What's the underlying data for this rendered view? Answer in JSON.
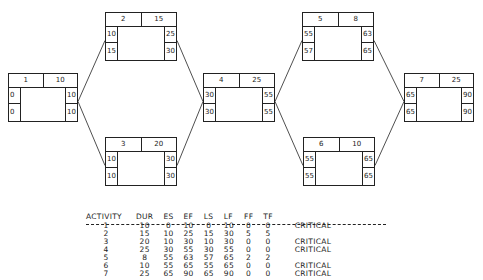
{
  "nodes": [
    {
      "id": "1",
      "dur": "10",
      "es": "0",
      "ls": "0",
      "ef": "10",
      "lf": "10",
      "x": 8,
      "y": 73,
      "w": 70,
      "h": 49
    },
    {
      "id": "2",
      "dur": "15",
      "es": "10",
      "ls": "15",
      "ef": "25",
      "lf": "30",
      "x": 105,
      "y": 12,
      "w": 72,
      "h": 49
    },
    {
      "id": "3",
      "dur": "20",
      "es": "10",
      "ls": "10",
      "ef": "30",
      "lf": "30",
      "x": 105,
      "y": 137,
      "w": 72,
      "h": 49
    },
    {
      "id": "4",
      "dur": "25",
      "es": "30",
      "ls": "30",
      "ef": "55",
      "lf": "55",
      "x": 203,
      "y": 73,
      "w": 72,
      "h": 49
    },
    {
      "id": "5",
      "dur": "8",
      "es": "55",
      "ls": "57",
      "ef": "63",
      "lf": "65",
      "x": 302,
      "y": 12,
      "w": 72,
      "h": 49
    },
    {
      "id": "6",
      "dur": "10",
      "es": "55",
      "ls": "55",
      "ef": "65",
      "lf": "65",
      "x": 303,
      "y": 137,
      "w": 72,
      "h": 49
    },
    {
      "id": "7",
      "dur": "25",
      "es": "65",
      "ls": "65",
      "ef": "90",
      "lf": "90",
      "x": 404,
      "y": 73,
      "w": 70,
      "h": 49
    }
  ],
  "edges": [
    {
      "from": "1",
      "to": "2"
    },
    {
      "from": "1",
      "to": "3"
    },
    {
      "from": "2",
      "to": "4"
    },
    {
      "from": "3",
      "to": "4"
    },
    {
      "from": "4",
      "to": "5"
    },
    {
      "from": "4",
      "to": "6"
    },
    {
      "from": "5",
      "to": "7"
    },
    {
      "from": "6",
      "to": "7"
    }
  ],
  "table": {
    "headers": [
      "ACTIVITY",
      "DUR",
      "ES",
      "EF",
      "LS",
      "LF",
      "FF",
      "TF",
      ""
    ],
    "rows": [
      [
        "1",
        "10",
        "0",
        "10",
        "0",
        "10",
        "0",
        "0",
        "CRITICAL"
      ],
      [
        "2",
        "15",
        "10",
        "25",
        "15",
        "30",
        "5",
        "5",
        ""
      ],
      [
        "3",
        "20",
        "10",
        "30",
        "10",
        "30",
        "0",
        "0",
        "CRITICAL"
      ],
      [
        "4",
        "25",
        "30",
        "55",
        "30",
        "55",
        "0",
        "0",
        "CRITICAL"
      ],
      [
        "5",
        "8",
        "55",
        "63",
        "57",
        "65",
        "2",
        "2",
        ""
      ],
      [
        "6",
        "10",
        "55",
        "65",
        "55",
        "65",
        "0",
        "0",
        "CRITICAL"
      ],
      [
        "7",
        "25",
        "65",
        "90",
        "65",
        "90",
        "0",
        "0",
        "CRITICAL"
      ]
    ]
  }
}
